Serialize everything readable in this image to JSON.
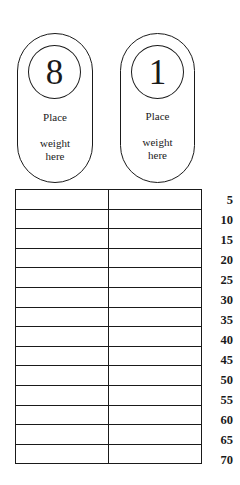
{
  "weights": [
    {
      "number": "8",
      "line1": "Place",
      "line2": "weight",
      "line3": "here"
    },
    {
      "number": "1",
      "line1": "Place",
      "line2": "weight",
      "line3": "here"
    }
  ],
  "table": {
    "columns": 2,
    "row_labels": [
      "5",
      "10",
      "15",
      "20",
      "25",
      "30",
      "35",
      "40",
      "45",
      "50",
      "55",
      "60",
      "65",
      "70"
    ]
  },
  "colors": {
    "line": "#1a1a1a",
    "background": "#ffffff"
  }
}
